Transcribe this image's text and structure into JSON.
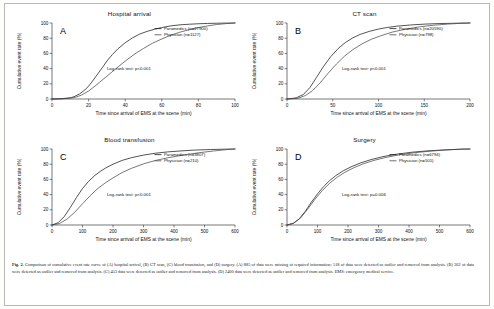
{
  "figure": {
    "caption_lead": "Fig. 2.",
    "caption_body": "Comparison of cumulative event rate curve of (A) hospital arrival, (B) CT scan, (C) blood transfusion, and (D) surgery. (A) 885 of data were missing of required information; 518 of data were detected as outlier and removed from analysis. (B) 362 of data were detected as outlier and removed from analysis. (C) 453 data were detected as outlier and removed from analysis. (D) 2400 data were detected as outlier and removed from analysis. EMS: emergency medical service."
  },
  "axis_titles": {
    "x": "Time since arrival of EMS at the scene (min)",
    "y": "Cumulative event rate (%)"
  },
  "chart_data": [
    {
      "type": "line",
      "panel_letter": "A",
      "title": "Hospital arrival",
      "xlabel": "Time since arrival of EMS at the scene (min)",
      "ylabel": "Cumulative event rate (%)",
      "xlim": [
        0,
        100
      ],
      "ylim": [
        0,
        100
      ],
      "xticks": [
        0,
        20,
        40,
        60,
        80,
        100
      ],
      "yticks": [
        0,
        20,
        40,
        60,
        80,
        100
      ],
      "grid": false,
      "legend_position": "top-right",
      "annotation": "Log-rank test: p<0.001",
      "series": [
        {
          "name": "Paramedics (n=27900)",
          "color": "#1b1b1b",
          "x": [
            0,
            5,
            10,
            12,
            15,
            18,
            20,
            22,
            25,
            28,
            30,
            33,
            36,
            40,
            44,
            48,
            52,
            56,
            60,
            65,
            70,
            75,
            80,
            85,
            90,
            95,
            100
          ],
          "y": [
            0,
            0.4,
            1.6,
            3.0,
            6.5,
            12.0,
            17.0,
            23.0,
            33.0,
            43.0,
            50.0,
            58.5,
            66.0,
            74.0,
            80.5,
            85.5,
            89.0,
            91.8,
            94.0,
            96.2,
            97.6,
            98.4,
            99.0,
            99.4,
            99.7,
            99.9,
            100.0
          ]
        },
        {
          "name": "Physician (n=1127)",
          "color": "#4a4a4a",
          "x": [
            0,
            5,
            10,
            13,
            16,
            20,
            23,
            26,
            30,
            34,
            38,
            42,
            46,
            50,
            55,
            60,
            65,
            70,
            75,
            80,
            85,
            90,
            95,
            100
          ],
          "y": [
            0,
            0.2,
            1.0,
            2.4,
            5.0,
            10.5,
            16.0,
            22.0,
            30.0,
            38.0,
            46.0,
            53.5,
            60.5,
            66.5,
            73.5,
            79.0,
            84.0,
            88.0,
            91.2,
            94.0,
            96.2,
            98.0,
            99.2,
            100.0
          ]
        }
      ]
    },
    {
      "type": "line",
      "panel_letter": "B",
      "title": "CT scan",
      "xlabel": "Time since arrival of EMS at the scene (min)",
      "ylabel": "Cumulative event rate (%)",
      "xlim": [
        0,
        200
      ],
      "ylim": [
        0,
        100
      ],
      "xticks": [
        0,
        50,
        100,
        150,
        200
      ],
      "yticks": [
        0,
        20,
        40,
        60,
        80,
        100
      ],
      "grid": false,
      "legend_position": "top-right",
      "annotation": "Log-rank test: p<0.001",
      "series": [
        {
          "name": "Paramedics (n=20590)",
          "color": "#1b1b1b",
          "x": [
            0,
            10,
            18,
            25,
            32,
            40,
            48,
            56,
            64,
            72,
            80,
            90,
            100,
            110,
            120,
            135,
            150,
            165,
            180,
            200
          ],
          "y": [
            0,
            1.5,
            6.0,
            15.0,
            28.0,
            43.0,
            56.0,
            66.5,
            74.5,
            80.5,
            85.0,
            89.0,
            92.0,
            94.2,
            95.8,
            97.4,
            98.5,
            99.2,
            99.6,
            100.0
          ]
        },
        {
          "name": "Physician (n=798)",
          "color": "#4a4a4a",
          "x": [
            0,
            12,
            20,
            28,
            36,
            45,
            54,
            63,
            72,
            82,
            92,
            102,
            115,
            130,
            145,
            160,
            175,
            190,
            200
          ],
          "y": [
            0,
            1.0,
            4.5,
            11.0,
            21.0,
            34.0,
            46.0,
            56.5,
            65.0,
            72.5,
            78.5,
            83.0,
            88.0,
            92.0,
            95.0,
            97.0,
            98.5,
            99.6,
            100.0
          ]
        }
      ]
    },
    {
      "type": "line",
      "panel_letter": "C",
      "title": "Blood transfusion",
      "xlabel": "Time since arrival of EMS at the scene (min)",
      "ylabel": "Cumulative event rate (%)",
      "xlim": [
        0,
        600
      ],
      "ylim": [
        0,
        100
      ],
      "xticks": [
        0,
        100,
        200,
        300,
        400,
        500,
        600
      ],
      "yticks": [
        0,
        20,
        40,
        60,
        80,
        100
      ],
      "grid": false,
      "legend_position": "top-right",
      "annotation": "Log-rank test: p<0.001",
      "series": [
        {
          "name": "Paramedics (n=3807)",
          "color": "#1b1b1b",
          "x": [
            0,
            20,
            40,
            60,
            80,
            100,
            120,
            140,
            160,
            180,
            200,
            230,
            260,
            300,
            340,
            380,
            420,
            470,
            520,
            570,
            600
          ],
          "y": [
            0,
            3.0,
            11.0,
            23.0,
            36.0,
            48.0,
            57.5,
            65.0,
            71.0,
            76.0,
            80.0,
            85.0,
            88.5,
            92.0,
            94.5,
            96.2,
            97.4,
            98.6,
            99.3,
            99.8,
            100.0
          ]
        },
        {
          "name": "Physician (n=210)",
          "color": "#4a4a4a",
          "x": [
            0,
            25,
            50,
            75,
            100,
            125,
            150,
            175,
            200,
            230,
            260,
            300,
            340,
            380,
            430,
            480,
            530,
            580,
            600
          ],
          "y": [
            0,
            2.0,
            8.0,
            17.0,
            28.0,
            38.5,
            48.0,
            55.5,
            62.0,
            69.0,
            74.5,
            80.5,
            85.0,
            88.5,
            92.0,
            95.0,
            97.4,
            99.5,
            100.0
          ]
        }
      ]
    },
    {
      "type": "line",
      "panel_letter": "D",
      "title": "Surgery",
      "xlabel": "Time since arrival of EMS at the scene (min)",
      "ylabel": "Cumulative event rate (%)",
      "xlim": [
        0,
        600
      ],
      "ylim": [
        0,
        100
      ],
      "xticks": [
        0,
        100,
        200,
        300,
        400,
        500,
        600
      ],
      "yticks": [
        0,
        20,
        40,
        60,
        80,
        100
      ],
      "grid": false,
      "legend_position": "top-right",
      "annotation": "Log-rank test: p=0.006",
      "series": [
        {
          "name": "Paramedics (n=6794)",
          "color": "#1b1b1b",
          "x": [
            0,
            20,
            40,
            60,
            80,
            100,
            120,
            140,
            160,
            185,
            210,
            240,
            275,
            315,
            360,
            410,
            460,
            520,
            570,
            600
          ],
          "y": [
            0,
            2.0,
            8.0,
            18.0,
            30.0,
            41.0,
            50.5,
            58.5,
            65.0,
            71.5,
            76.5,
            81.5,
            86.0,
            90.0,
            93.2,
            95.8,
            97.5,
            98.9,
            99.8,
            100.0
          ]
        },
        {
          "name": "Physician (n=505)",
          "color": "#4a4a4a",
          "x": [
            0,
            22,
            45,
            68,
            90,
            115,
            140,
            165,
            190,
            220,
            250,
            285,
            325,
            370,
            420,
            470,
            525,
            575,
            600
          ],
          "y": [
            0,
            2.5,
            9.5,
            21.0,
            33.0,
            45.0,
            55.0,
            63.0,
            69.5,
            75.5,
            80.5,
            85.0,
            89.0,
            92.5,
            95.2,
            97.2,
            98.8,
            99.8,
            100.0
          ]
        }
      ]
    }
  ]
}
